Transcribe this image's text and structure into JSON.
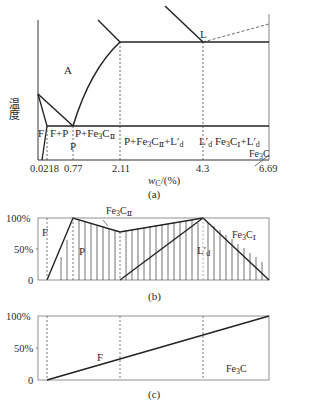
{
  "panel_a": {
    "caption": "(a)",
    "ylabel": "温度",
    "xlabel_italic": "w",
    "xlabel_sub": "C",
    "xlabel_rest": "/(%)",
    "x_ticks": [
      "0.0218",
      "0.77",
      "2.11",
      "4.3",
      "6.69"
    ],
    "regions": {
      "austenite": "A",
      "liquid_point": "L",
      "ferrite": "F",
      "f_plus_p": "F+P",
      "pearlite_point": "P",
      "p_plus_fe3c2": "P+Fe",
      "p_plus_fe3c2_sub1": "3",
      "p_plus_fe3c2_sub2": "C",
      "p_plus_fe3c2_sub3": "Ⅱ",
      "hypo_eutectic": "P+Fe",
      "hypo_sub": "3",
      "hypo_c": "C",
      "hypo_ii": "Ⅱ",
      "hypo_plus_l": "+L′",
      "hypo_l_sub": "d",
      "ledeburite": "L′",
      "ledeburite_sub": "d",
      "hyper_fe": "Fe",
      "hyper_sub": "3",
      "hyper_c": "C",
      "hyper_i": "Ⅰ",
      "hyper_plus_l": "+L′",
      "hyper_l_sub": "d",
      "cementite_fe": "Fe",
      "cementite_sub": "3",
      "cementite_c": "C"
    }
  },
  "panel_b": {
    "caption": "(b)",
    "y_ticks": [
      "100%",
      "50%",
      "0"
    ],
    "labels": {
      "ferrite": "F",
      "pearlite": "P",
      "fe3c2_fe": "Fe",
      "fe3c2_sub": "3",
      "fe3c2_c": "C",
      "fe3c2_ii": "Ⅱ",
      "ledeburite": "L′",
      "ledeburite_sub": "d",
      "fe3c1_fe": "Fe",
      "fe3c1_sub": "3",
      "fe3c1_c": "C",
      "fe3c1_i": "Ⅰ"
    }
  },
  "panel_c": {
    "caption": "(c)",
    "y_ticks": [
      "100%",
      "50%",
      "0"
    ],
    "labels": {
      "ferrite": "F",
      "cementite_fe": "Fe",
      "cementite_sub": "3",
      "cementite_c": "C"
    }
  }
}
